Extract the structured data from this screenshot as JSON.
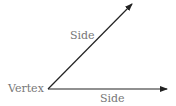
{
  "diagram": {
    "labels": {
      "upper_side": "Side",
      "vertex": "Vertex",
      "lower_side": "Side"
    },
    "colors": {
      "line": "#222222",
      "label": "#777777",
      "background": "#ffffff"
    },
    "geometry": {
      "vertex": [
        48,
        89
      ],
      "upper_ray_end": [
        133,
        3
      ],
      "lower_ray_end": [
        168,
        89
      ]
    }
  }
}
